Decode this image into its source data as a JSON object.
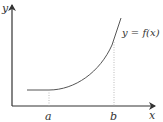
{
  "diagram": {
    "axes": {
      "x_label": "x",
      "y_label": "y"
    },
    "curve_label": "y = f(x)",
    "markers": [
      {
        "label": "a"
      },
      {
        "label": "b"
      }
    ],
    "colors": {
      "axis": "#333333",
      "curve": "#555555",
      "guide": "#aaaaaa"
    }
  }
}
